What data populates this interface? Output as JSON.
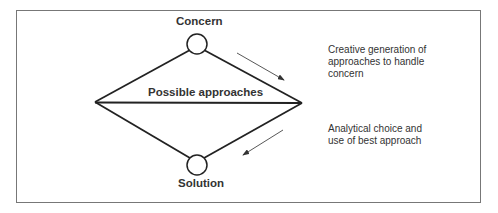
{
  "diagram": {
    "top_node": {
      "label": "Concern"
    },
    "bottom_node": {
      "label": "Solution"
    },
    "middle_label": "Possible approaches",
    "annotations": {
      "divergent": [
        "Creative generation of",
        "approaches to handle",
        "concern"
      ],
      "convergent": [
        "Analytical choice and",
        "use of best approach"
      ]
    },
    "colors": {
      "line": "#222222",
      "text": "#333333",
      "frame": "#777777"
    }
  }
}
